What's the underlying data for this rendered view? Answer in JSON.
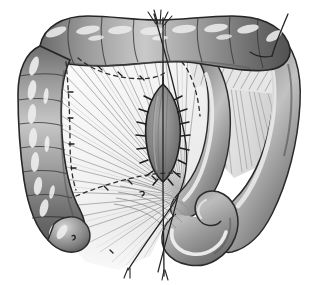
{
  "figure": {
    "type": "anatomical-line-and-wash-drawing",
    "medium": "grayscale halftone",
    "canvas": {
      "width": 321,
      "height": 285,
      "background": "#ffffff"
    },
    "caption": "",
    "labels": []
  },
  "palette": {
    "background": "#ffffff",
    "ink": "#1a1a1a",
    "bowel_mid": "#8f8f8f",
    "bowel_light": "#b9b9b9",
    "bowel_highlight": "#e4e4e4",
    "bowel_shadow": "#5a5a5a",
    "bowel_deep_shadow": "#3d3d3d",
    "mesentery_base": "#f2f2f2",
    "mesentery_fiber": "#9a9a9a",
    "mesentery_fiber_light": "#c8c8c8",
    "suture_thread": "#2b2b2b",
    "dashed_line": "#2f2f2f",
    "defect_fill": "#8a8a8a",
    "defect_shadow": "#636363"
  },
  "structures": [
    {
      "id": "transverse-colon",
      "name": "Transverse colon",
      "region": "top",
      "feature": "haustra",
      "haustra_count": 9,
      "description": "Horizontal haustrated bowel running across the upper border"
    },
    {
      "id": "descending-colon-limb",
      "name": "Descending colon limb",
      "region": "left",
      "feature": "haustra",
      "haustra_count": 8,
      "description": "Vertical haustrated bowel forming the left border"
    },
    {
      "id": "hepatic-flexure",
      "name": "Colic flexure",
      "region": "top-left-corner",
      "feature": "curve",
      "description": "Rounded corner joining the transverse and vertical limbs"
    },
    {
      "id": "right-colon-limb",
      "name": "Right colon limb",
      "region": "right",
      "feature": "smooth-wall",
      "description": "Broad smooth bowel limb descending along the right margin"
    },
    {
      "id": "bowel-loop",
      "name": "Coiled bowel loop",
      "region": "bottom-center-right",
      "feature": "spiral-coil",
      "description": "Tightly curled loop of bowel with bright inner highlight"
    },
    {
      "id": "mesentery-fan",
      "name": "Mesentery",
      "region": "center-left",
      "feature": "radiating-vessels",
      "vessel_count": 54,
      "description": "Translucent fan of mesentery with radiating vessel striations converging at the root"
    },
    {
      "id": "mesenteric-defect",
      "name": "Sutured mesenteric defect",
      "region": "center",
      "feature": "almond-shape-with-stitches",
      "stitch_count": 16,
      "description": "Leaf/almond-shaped sutured closure with interrupted stitches along both margins"
    },
    {
      "id": "vessel-root",
      "name": "Mesenteric vascular root",
      "region": "center-lower",
      "feature": "convergence-point",
      "description": "Point where the radiating mesenteric vessels converge"
    }
  ],
  "markings": [
    {
      "id": "resection-line-upper",
      "name": "Dashed resection line (upper)",
      "style": "dashed",
      "description": "Dashed planned-incision line arcing across the upper mesentery"
    },
    {
      "id": "resection-line-lower",
      "name": "Dashed resection line (lower)",
      "style": "dashed",
      "description": "Dashed planned-incision line sweeping through the lower mesentery"
    },
    {
      "id": "suture-thread-vertical",
      "name": "Vertical suture thread",
      "style": "solid-thin",
      "description": "Long traction thread running top to bottom through the defect"
    },
    {
      "id": "suture-thread-diagonal",
      "name": "Diagonal suture thread",
      "style": "solid-thin",
      "description": "Traction thread crossing diagonally from upper-centre to lower-left"
    },
    {
      "id": "suture-thread-right",
      "name": "Right anchor thread",
      "style": "solid-thin",
      "description": "Short thread anchored into the upper-right bowel wall"
    },
    {
      "id": "thread-tails-top",
      "name": "Thread tails",
      "style": "splayed-strands",
      "description": "Free suture tails splaying above the transverse colon"
    }
  ]
}
